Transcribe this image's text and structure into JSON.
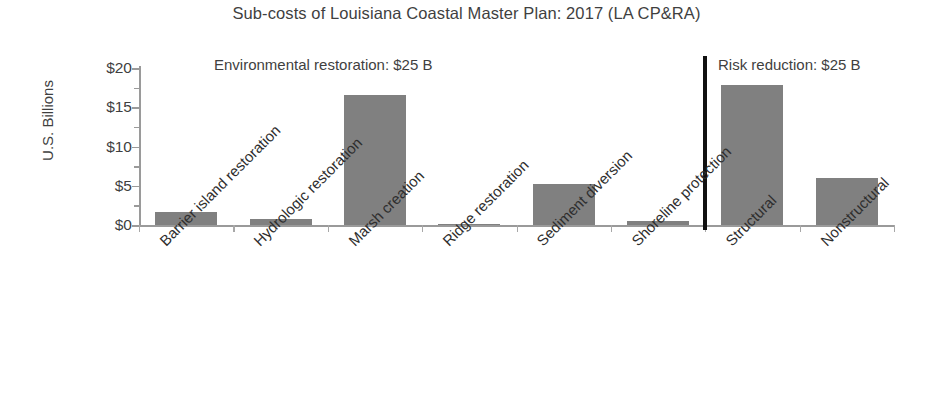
{
  "chart_data": {
    "type": "bar",
    "title": "Sub-costs of Louisiana Coastal Master Plan: 2017 (LA CP&RA)",
    "xlabel": "",
    "ylabel": "U.S. Billions",
    "ylim": [
      0,
      20
    ],
    "ytick_labels": [
      "$0",
      "$5",
      "$10",
      "$15",
      "$20"
    ],
    "ytick_values": [
      0,
      5,
      10,
      15,
      20
    ],
    "grid": false,
    "legend": "none",
    "bar_color": "#808080",
    "categories": [
      "Barrier island restoration",
      "Hydrologic restoration",
      "Marsh creation",
      "Ridge restoration",
      "Sediment diversion",
      "Shoreline protection",
      "Structural",
      "Nonstructural"
    ],
    "values": [
      1.6,
      0.8,
      16.5,
      0.1,
      5.2,
      0.5,
      17.9,
      6.0
    ],
    "annotations": [
      {
        "text": "Environmental restoration: $25 B",
        "group": "left"
      },
      {
        "text": "Risk reduction: $25 B",
        "group": "right"
      }
    ],
    "divider": {
      "after_category": "Shoreline protection",
      "color": "#111111"
    }
  }
}
